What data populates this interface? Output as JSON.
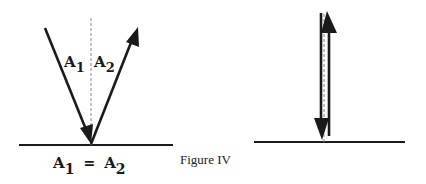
{
  "figure": {
    "caption": "Figure IV",
    "colors": {
      "ink": "#1a1a1a",
      "dashed_normal": "#888888",
      "background": "#ffffff"
    },
    "left_panel": {
      "description": "Oblique reflection: angle of incidence equals angle of reflection",
      "incident_label": {
        "letter": "A",
        "sub": "1"
      },
      "reflected_label": {
        "letter": "A",
        "sub": "2"
      },
      "equation": {
        "lhs_letter": "A",
        "lhs_sub": "1",
        "op": "=",
        "rhs_letter": "A",
        "rhs_sub": "2"
      }
    },
    "right_panel": {
      "description": "Normal incidence: ray reflects straight back along the normal"
    }
  }
}
